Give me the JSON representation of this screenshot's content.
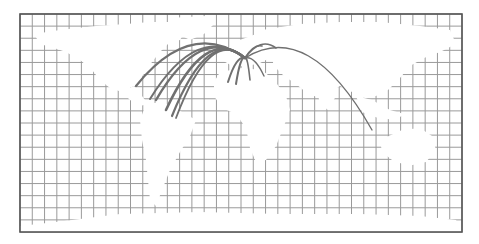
{
  "map": {
    "type": "flow-map",
    "projection": "equirectangular-world",
    "frame": {
      "x": 20,
      "y": 14,
      "width": 442,
      "height": 218
    },
    "grid": {
      "columns": 36,
      "rows": 18,
      "color": "#9a9a9a"
    },
    "colors": {
      "background": "#ffffff",
      "land": "#ffffff",
      "frame": "#555555",
      "flow": "#707070"
    },
    "hub": {
      "label": "",
      "x": 245,
      "y": 58
    },
    "flows": [
      {
        "to_region": "north-america-west",
        "x": 136,
        "y": 86,
        "width": 2.2
      },
      {
        "to_region": "north-america-central",
        "x": 150,
        "y": 99,
        "width": 2
      },
      {
        "to_region": "caribbean",
        "x": 156,
        "y": 100,
        "width": 2.4
      },
      {
        "to_region": "south-america-north",
        "x": 166,
        "y": 110,
        "width": 2.6
      },
      {
        "to_region": "south-america-east",
        "x": 172,
        "y": 116,
        "width": 2.2
      },
      {
        "to_region": "south-america-south",
        "x": 176,
        "y": 118,
        "width": 1.8
      },
      {
        "to_region": "west-africa",
        "x": 228,
        "y": 82,
        "width": 2
      },
      {
        "to_region": "central-africa",
        "x": 236,
        "y": 84,
        "width": 2
      },
      {
        "to_region": "east-africa",
        "x": 250,
        "y": 80,
        "width": 1.6
      },
      {
        "to_region": "middle-east",
        "x": 264,
        "y": 76,
        "width": 1.4
      },
      {
        "to_region": "russia",
        "x": 276,
        "y": 48,
        "width": 1.6
      },
      {
        "to_region": "scandinavia",
        "x": 262,
        "y": 46,
        "width": 1.6
      },
      {
        "to_region": "australia",
        "x": 372,
        "y": 130,
        "width": 1.4
      }
    ]
  }
}
